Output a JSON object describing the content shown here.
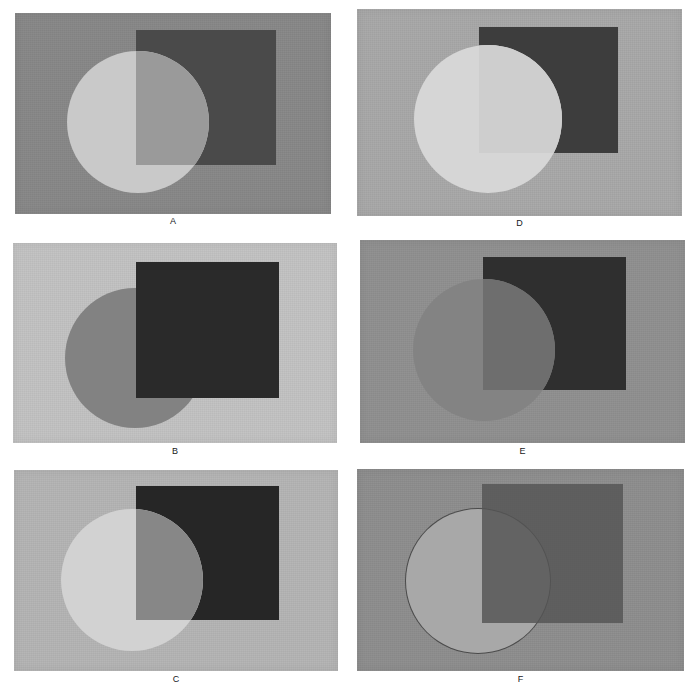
{
  "figure": {
    "background_color": "#ffffff",
    "width": 694,
    "height": 692,
    "columns": 2,
    "rows": 3
  },
  "panels": [
    {
      "id": "A",
      "label": "A",
      "grid": {
        "column": 1,
        "row": 1
      },
      "rect": {
        "x": 15,
        "y": 13,
        "w": 316,
        "h": 201
      },
      "caption_y": 216,
      "background_color": "#878787",
      "square": {
        "x": 121,
        "y": 17,
        "w": 140,
        "h": 135,
        "color": "#4a4a4a",
        "on_top": false
      },
      "circle": {
        "cx": 123,
        "cy": 109,
        "r": 71,
        "color": "#c9c9c9",
        "outline": "none"
      },
      "overlap_color": "#9a9a9a",
      "description": "Light disk appears in front; the part crossing the dark square is mid gray, square drawn under the disk"
    },
    {
      "id": "D",
      "label": "D",
      "grid": {
        "column": 2,
        "row": 1
      },
      "rect": {
        "x": 357,
        "y": 9,
        "w": 325,
        "h": 207
      },
      "caption_y": 218,
      "background_color": "#a8a8a8",
      "square": {
        "x": 122,
        "y": 18,
        "w": 139,
        "h": 126,
        "color": "#3d3d3d",
        "on_top": false
      },
      "circle": {
        "cx": 131,
        "cy": 110,
        "r": 74,
        "color": "#d6d6d6",
        "outline": "none"
      },
      "overlap_color": "#cecece",
      "description": "Very light disk, its overlap with the dark square is only slightly darker than the disk"
    },
    {
      "id": "B",
      "label": "B",
      "grid": {
        "column": 1,
        "row": 2
      },
      "rect": {
        "x": 13,
        "y": 243,
        "w": 324,
        "h": 200
      },
      "caption_y": 446,
      "background_color": "#c2c2c2",
      "square": {
        "x": 123,
        "y": 19,
        "w": 143,
        "h": 136,
        "color": "#2a2a2a",
        "on_top": true
      },
      "circle": {
        "cx": 122,
        "cy": 115,
        "r": 70,
        "color": "#828282",
        "outline": "none"
      },
      "overlap_color": "#333333",
      "description": "Opaque very dark square painted on top of a mid gray disk"
    },
    {
      "id": "E",
      "label": "E",
      "grid": {
        "column": 2,
        "row": 2
      },
      "rect": {
        "x": 360,
        "y": 240,
        "w": 325,
        "h": 203
      },
      "caption_y": 446,
      "background_color": "#8f8f8f",
      "square": {
        "x": 123,
        "y": 17,
        "w": 143,
        "h": 133,
        "color": "#2f2f2f",
        "on_top": false
      },
      "circle": {
        "cx": 124,
        "cy": 110,
        "r": 71,
        "color": "#838383",
        "outline": "none"
      },
      "overlap_color": "#6e6e6e",
      "description": "Mid gray disk over a near black square; overlap is slightly darker than the disk"
    },
    {
      "id": "C",
      "label": "C",
      "grid": {
        "column": 1,
        "row": 3
      },
      "rect": {
        "x": 14,
        "y": 470,
        "w": 324,
        "h": 201
      },
      "caption_y": 674,
      "background_color": "#b4b4b4",
      "square": {
        "x": 122,
        "y": 16,
        "w": 143,
        "h": 134,
        "color": "#262626",
        "on_top": false
      },
      "circle": {
        "cx": 118,
        "cy": 110,
        "r": 71,
        "color": "#d2d2d2",
        "outline": "none"
      },
      "overlap_color": "#878787",
      "description": "Pale cream disk; the portion over the black square reads as mid gray"
    },
    {
      "id": "F",
      "label": "F",
      "grid": {
        "column": 2,
        "row": 3
      },
      "rect": {
        "x": 357,
        "y": 469,
        "w": 327,
        "h": 202
      },
      "caption_y": 674,
      "background_color": "#8d8d8d",
      "square": {
        "x": 125,
        "y": 15,
        "w": 141,
        "h": 139,
        "color": "#545454",
        "on_top": true,
        "opacity": 0.82
      },
      "circle": {
        "cx": 121,
        "cy": 112,
        "r": 72,
        "color": "#a8a8a8",
        "outline": "#4b4b4b"
      },
      "overlap_color": "#6a6a6a",
      "description": "Translucent dark square laid over a light gray disk with a thin dark disk outline"
    }
  ],
  "colors": {
    "page_background": "#ffffff",
    "caption_text": "#16181a"
  }
}
